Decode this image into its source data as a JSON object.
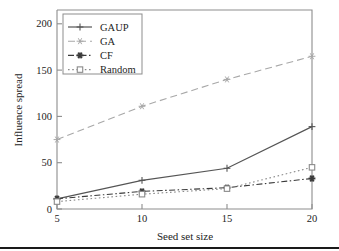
{
  "chart_data": {
    "type": "line",
    "title": "",
    "xlabel": "Seed set size",
    "ylabel": "Influence spread",
    "x": [
      5,
      10,
      15,
      20
    ],
    "xticklabels": [
      "5",
      "10",
      "15",
      "20"
    ],
    "yticklabels": [
      "0",
      "50",
      "100",
      "150",
      "200"
    ],
    "yticks": [
      0,
      50,
      100,
      150,
      200
    ],
    "xlim": [
      5,
      20
    ],
    "ylim": [
      0,
      215
    ],
    "grid": false,
    "legend_position": "upper left",
    "series": [
      {
        "name": "GAUP",
        "values": [
          11,
          31,
          44,
          89
        ],
        "marker": "plus",
        "linestyle": "solid",
        "color": "#555555"
      },
      {
        "name": "GA",
        "values": [
          75,
          111,
          140,
          165
        ],
        "marker": "asterisk",
        "linestyle": "dashed",
        "color": "#a8a8a8"
      },
      {
        "name": "CF",
        "values": [
          11,
          19,
          23,
          33
        ],
        "marker": "star-filled",
        "linestyle": "dashdot",
        "color": "#3a3a3a"
      },
      {
        "name": "Random",
        "values": [
          8,
          16,
          22,
          45
        ],
        "marker": "square-open",
        "linestyle": "dotted",
        "color": "#8a8a8a"
      }
    ]
  },
  "figure": {
    "axis_color": "#8d8d8d",
    "text_color": "#242424",
    "background": "#ffffff",
    "footer_rule_color": "#1a1a1a"
  }
}
